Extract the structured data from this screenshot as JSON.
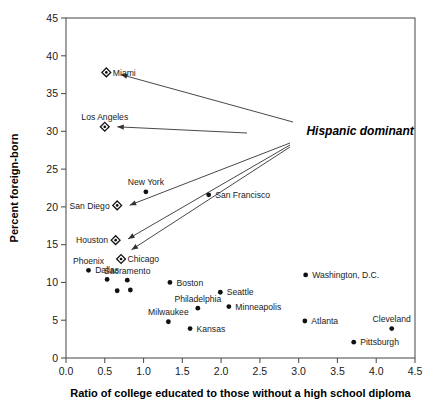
{
  "chart_data": {
    "type": "scatter",
    "title": "",
    "xlabel": "Ratio of college educated to those without a high school diploma",
    "ylabel": "Percent foreign-born",
    "xlim": [
      0.0,
      4.5
    ],
    "ylim": [
      0,
      45
    ],
    "xticks": [
      "0.0",
      "0.5",
      "1.0",
      "1.5",
      "2.0",
      "2.5",
      "3.0",
      "3.5",
      "4.0",
      "4.5"
    ],
    "yticks": [
      "0",
      "5",
      "10",
      "15",
      "20",
      "25",
      "30",
      "35",
      "40",
      "45"
    ],
    "xtick_step": 0.5,
    "ytick_step": 5,
    "grid": false,
    "legend": "none",
    "marker_types": {
      "diamond": "Hispanic dominant metro area",
      "circle": "Other metro area"
    },
    "annotations": [
      {
        "text": "Hispanic dominant",
        "x": 3.1,
        "y": 30.0,
        "points_to": [
          "Miami",
          "Los Angeles",
          "San Diego",
          "Houston",
          "Chicago"
        ]
      }
    ],
    "points": [
      {
        "label": "Miami",
        "x": 0.52,
        "y": 37.8,
        "marker": "diamond",
        "label_pos": "right"
      },
      {
        "label": "Los Angeles",
        "x": 0.5,
        "y": 30.6,
        "marker": "diamond",
        "label_pos": "above"
      },
      {
        "label": "New York",
        "x": 1.03,
        "y": 22.0,
        "marker": "circle",
        "label_pos": "above"
      },
      {
        "label": "San Francisco",
        "x": 1.84,
        "y": 21.6,
        "marker": "circle",
        "label_pos": "right"
      },
      {
        "label": "San Diego",
        "x": 0.66,
        "y": 20.2,
        "marker": "diamond",
        "label_pos": "left"
      },
      {
        "label": "Houston",
        "x": 0.64,
        "y": 15.6,
        "marker": "diamond",
        "label_pos": "left"
      },
      {
        "label": "Chicago",
        "x": 0.71,
        "y": 13.1,
        "marker": "diamond",
        "label_pos": "right"
      },
      {
        "label": "Phoenix",
        "x": 0.29,
        "y": 11.6,
        "marker": "circle",
        "label_pos": "above"
      },
      {
        "label": "Washington, D.C.",
        "x": 3.09,
        "y": 11.0,
        "marker": "circle",
        "label_pos": "right"
      },
      {
        "label": "Dallas",
        "x": 0.53,
        "y": 10.4,
        "marker": "circle",
        "label_pos": "above"
      },
      {
        "label": "Sacramento",
        "x": 0.79,
        "y": 10.3,
        "marker": "circle",
        "label_pos": "above"
      },
      {
        "label": "Boston",
        "x": 1.34,
        "y": 10.0,
        "marker": "circle",
        "label_pos": "right"
      },
      {
        "label": "Seattle",
        "x": 1.99,
        "y": 8.7,
        "marker": "circle",
        "label_pos": "right"
      },
      {
        "label": "",
        "x": 0.66,
        "y": 8.9,
        "marker": "circle",
        "label_pos": "none"
      },
      {
        "label": "",
        "x": 0.83,
        "y": 9.0,
        "marker": "circle",
        "label_pos": "none"
      },
      {
        "label": "Minneapolis",
        "x": 2.1,
        "y": 6.8,
        "marker": "circle",
        "label_pos": "right"
      },
      {
        "label": "Philadelphia",
        "x": 1.7,
        "y": 6.6,
        "marker": "circle",
        "label_pos": "above"
      },
      {
        "label": "Atlanta",
        "x": 3.08,
        "y": 4.9,
        "marker": "circle",
        "label_pos": "right"
      },
      {
        "label": "Milwaukee",
        "x": 1.32,
        "y": 4.8,
        "marker": "circle",
        "label_pos": "above"
      },
      {
        "label": "Kansas",
        "x": 1.6,
        "y": 3.9,
        "marker": "circle",
        "label_pos": "right"
      },
      {
        "label": "Cleveland",
        "x": 4.2,
        "y": 3.9,
        "marker": "circle",
        "label_pos": "above"
      },
      {
        "label": "Pittsburgh",
        "x": 3.71,
        "y": 2.1,
        "marker": "circle",
        "label_pos": "right"
      }
    ]
  }
}
